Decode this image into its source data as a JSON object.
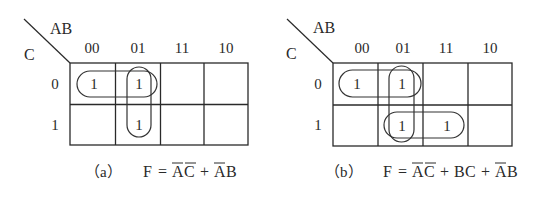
{
  "maps": [
    {
      "id": "a",
      "row_var": "C",
      "col_var": "AB",
      "col_labels": [
        "00",
        "01",
        "11",
        "10"
      ],
      "row_labels": [
        "0",
        "1"
      ],
      "cells": [
        [
          "1",
          "1",
          "",
          ""
        ],
        [
          "",
          "1",
          "",
          ""
        ]
      ],
      "caption": {
        "prefix": "（a）",
        "lhs": "F = ",
        "terms": [
          {
            "text": "AC",
            "overbar": "both",
            "letters": [
              "A",
              "C"
            ]
          },
          {
            "sep": " + "
          },
          {
            "text": "AB",
            "overbar": "first",
            "letters": [
              "A",
              "B"
            ]
          }
        ]
      },
      "groupings": [
        "row0: cols 00-01 (A'C')",
        "col 01: rows 0-1 (A'B)"
      ]
    },
    {
      "id": "b",
      "row_var": "C",
      "col_var": "AB",
      "col_labels": [
        "00",
        "01",
        "11",
        "10"
      ],
      "row_labels": [
        "0",
        "1"
      ],
      "cells": [
        [
          "1",
          "1",
          "",
          ""
        ],
        [
          "",
          "1",
          "1",
          ""
        ]
      ],
      "caption": {
        "prefix": "（b）",
        "lhs": "F = ",
        "terms": [
          {
            "text": "AC",
            "overbar": "both",
            "letters": [
              "A",
              "C"
            ]
          },
          {
            "sep": " + "
          },
          {
            "text": "BC",
            "overbar": "none",
            "letters": [
              "B",
              "C"
            ]
          },
          {
            "sep": " + "
          },
          {
            "text": "AB",
            "overbar": "first",
            "letters": [
              "A",
              "B"
            ]
          }
        ]
      },
      "groupings": [
        "row0: cols 00-01 (A'C')",
        "row1: cols 01-11 (BC)",
        "col 01: rows 0-1 (A'B)"
      ]
    }
  ],
  "caption_text": {
    "a": {
      "prefix": "（a）",
      "F": "F",
      "eq": "=",
      "t1a": "A",
      "t1b": "C",
      "plus1": "+",
      "t2a": "A",
      "t2b": "B"
    },
    "b": {
      "prefix": "（b）",
      "F": "F",
      "eq": "=",
      "t1a": "A",
      "t1b": "C",
      "plus1": "+",
      "t2a": "B",
      "t2b": "C",
      "plus2": "+",
      "t3a": "A",
      "t3b": "B"
    }
  },
  "colors": {
    "ink": "#2a2a2a",
    "background": "#ffffff"
  }
}
